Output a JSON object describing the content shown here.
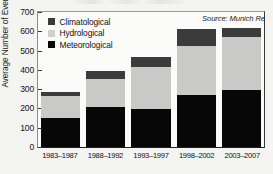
{
  "chart_data": {
    "type": "bar",
    "subtype": "stacked-vertical",
    "title": "",
    "xlabel": "",
    "ylabel": "Average Number of Events",
    "ylim": [
      0,
      700
    ],
    "yticks": [
      0,
      100,
      200,
      300,
      400,
      500,
      600,
      700
    ],
    "grid": false,
    "legend_position": "top-left",
    "annotations": [
      "Source: Munich Re"
    ],
    "source": "Source: Munich Re",
    "categories": [
      "1983–1987",
      "1988–1992",
      "1993–1997",
      "1998–2002",
      "2003–2007"
    ],
    "series": [
      {
        "name": "Meteorological",
        "color": "#070707",
        "values": [
          150,
          205,
          195,
          270,
          298
        ]
      },
      {
        "name": "Hydrological",
        "color": "#c9c9c7",
        "values": [
          115,
          150,
          218,
          252,
          270
        ]
      },
      {
        "name": "Climatological",
        "color": "#3b3b3b",
        "values": [
          20,
          40,
          52,
          90,
          50
        ]
      }
    ],
    "totals": [
      285,
      395,
      465,
      612,
      618
    ]
  },
  "axis": {
    "y_label": "Average Number of Events",
    "y_ticks": [
      "700",
      "600",
      "500",
      "400",
      "300",
      "200",
      "100",
      "0"
    ],
    "x_ticks": [
      "1983–1987",
      "1988–1992",
      "1993–1997",
      "1998–2002",
      "2003–2007"
    ]
  },
  "legend": {
    "items": [
      {
        "label": "Climatological",
        "color": "#3b3b3b"
      },
      {
        "label": "Hydrological",
        "color": "#cfcfcd"
      },
      {
        "label": "Meteorological",
        "color": "#070707"
      }
    ]
  },
  "source": {
    "text": "Source: Munich Re"
  },
  "colors": {
    "meteorological": "#070707",
    "hydrological": "#c9c9c7",
    "climatological": "#3b3b3b",
    "plot_background": "#fbfbfa",
    "page_background": "#f2f2f0"
  }
}
